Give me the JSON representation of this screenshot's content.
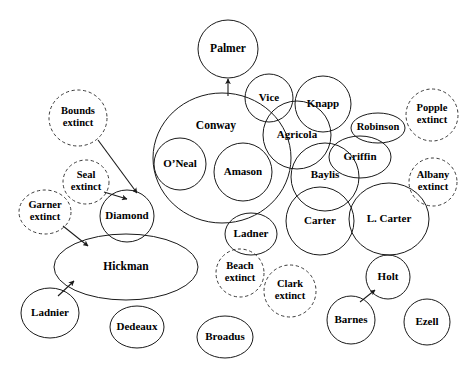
{
  "diagram": {
    "width": 473,
    "height": 369,
    "background_color": "#ffffff",
    "stroke_color": "#1a1a1a",
    "dashed_stroke_color": "#3a3a3a",
    "label_color": "#000000",
    "legend": {
      "solid_meaning": "existing family",
      "dashed_meaning": "extinct family"
    },
    "nodes": [
      {
        "id": "palmer",
        "label": "Palmer",
        "cx": 228,
        "cy": 49,
        "rx": 30,
        "ry": 29,
        "style": "solid",
        "font_size": 11.5,
        "lines": [
          "Palmer"
        ]
      },
      {
        "id": "conway",
        "label": "Conway",
        "cx": 222,
        "cy": 158,
        "rx": 69,
        "ry": 65,
        "style": "solid",
        "font_size": 11.5,
        "lines": [
          "Conway"
        ],
        "label_cx": 216,
        "label_cy": 126
      },
      {
        "id": "oneal",
        "label": "O’Neal",
        "cx": 180,
        "cy": 164,
        "rx": 26,
        "ry": 26,
        "style": "solid",
        "font_size": 11,
        "lines": [
          "O’Neal"
        ]
      },
      {
        "id": "amason",
        "label": "Amason",
        "cx": 243,
        "cy": 172,
        "rx": 29,
        "ry": 29,
        "style": "solid",
        "font_size": 11,
        "lines": [
          "Amason"
        ]
      },
      {
        "id": "vice",
        "label": "Vice",
        "cx": 269,
        "cy": 98,
        "rx": 24,
        "ry": 24,
        "style": "solid",
        "font_size": 11,
        "lines": [
          "Vice"
        ]
      },
      {
        "id": "knapp",
        "label": "Knapp",
        "cx": 323,
        "cy": 104,
        "rx": 28,
        "ry": 28,
        "style": "solid",
        "font_size": 11,
        "lines": [
          "Knapp"
        ]
      },
      {
        "id": "agricola",
        "label": "Agricola",
        "cx": 297,
        "cy": 135,
        "rx": 34,
        "ry": 34,
        "style": "solid",
        "font_size": 11,
        "lines": [
          "Agricola"
        ]
      },
      {
        "id": "robinson",
        "label": "Robinson",
        "cx": 378,
        "cy": 128,
        "rx": 27,
        "ry": 15,
        "style": "solid",
        "font_size": 10.5,
        "lines": [
          "Robinson"
        ]
      },
      {
        "id": "griffin",
        "label": "Griffin",
        "cx": 360,
        "cy": 157,
        "rx": 31,
        "ry": 21,
        "style": "solid",
        "font_size": 11,
        "lines": [
          "Griffin"
        ]
      },
      {
        "id": "baylis",
        "label": "Baylis",
        "cx": 325,
        "cy": 177,
        "rx": 34,
        "ry": 34,
        "style": "solid",
        "font_size": 11,
        "lines": [
          "Baylis"
        ],
        "label_cy": 175
      },
      {
        "id": "carter",
        "label": "Carter",
        "cx": 320,
        "cy": 221,
        "rx": 34,
        "ry": 34,
        "style": "solid",
        "font_size": 11,
        "lines": [
          "Carter"
        ]
      },
      {
        "id": "lcarter",
        "label": "L. Carter",
        "cx": 389,
        "cy": 219,
        "rx": 40,
        "ry": 36,
        "style": "solid",
        "font_size": 11,
        "lines": [
          "L. Carter"
        ]
      },
      {
        "id": "ladner",
        "label": "Ladner",
        "cx": 251,
        "cy": 234,
        "rx": 26,
        "ry": 21,
        "style": "solid",
        "font_size": 11,
        "lines": [
          "Ladner"
        ]
      },
      {
        "id": "diamond",
        "label": "Diamond",
        "cx": 127,
        "cy": 216,
        "rx": 27,
        "ry": 26,
        "style": "solid",
        "font_size": 11,
        "lines": [
          "Diamond"
        ]
      },
      {
        "id": "hickman",
        "label": "Hickman",
        "cx": 126,
        "cy": 267,
        "rx": 72,
        "ry": 33,
        "style": "solid",
        "font_size": 11.5,
        "lines": [
          "Hickman"
        ]
      },
      {
        "id": "ladnier",
        "label": "Ladnier",
        "cx": 50,
        "cy": 313,
        "rx": 29,
        "ry": 25,
        "style": "solid",
        "font_size": 11,
        "lines": [
          "Ladnier"
        ]
      },
      {
        "id": "dedeaux",
        "label": "Dedeaux",
        "cx": 137,
        "cy": 327,
        "rx": 27,
        "ry": 21,
        "style": "solid",
        "font_size": 11,
        "lines": [
          "Dedeaux"
        ]
      },
      {
        "id": "broadus",
        "label": "Broadus",
        "cx": 225,
        "cy": 337,
        "rx": 28,
        "ry": 21,
        "style": "solid",
        "font_size": 11,
        "lines": [
          "Broadus"
        ]
      },
      {
        "id": "holt",
        "label": "Holt",
        "cx": 388,
        "cy": 277,
        "rx": 22,
        "ry": 22,
        "style": "solid",
        "font_size": 11,
        "lines": [
          "Holt"
        ]
      },
      {
        "id": "barnes",
        "label": "Barnes",
        "cx": 351,
        "cy": 320,
        "rx": 24,
        "ry": 24,
        "style": "solid",
        "font_size": 11,
        "lines": [
          "Barnes"
        ]
      },
      {
        "id": "ezell",
        "label": "Ezell",
        "cx": 427,
        "cy": 322,
        "rx": 23,
        "ry": 23,
        "style": "solid",
        "font_size": 11,
        "lines": [
          "Ezell"
        ]
      },
      {
        "id": "bounds",
        "label": "Bounds extinct",
        "cx": 78,
        "cy": 118,
        "rx": 29,
        "ry": 28,
        "style": "dashed",
        "font_size": 10.5,
        "lines": [
          "Bounds",
          "extinct"
        ]
      },
      {
        "id": "seal",
        "label": "Seal extinct",
        "cx": 86,
        "cy": 182,
        "rx": 23,
        "ry": 22,
        "style": "dashed",
        "font_size": 10.5,
        "lines": [
          "Seal",
          "extinct"
        ]
      },
      {
        "id": "garner",
        "label": "Garner extinct",
        "cx": 45,
        "cy": 212,
        "rx": 26,
        "ry": 22,
        "style": "dashed",
        "font_size": 10.5,
        "lines": [
          "Garner",
          "extinct"
        ]
      },
      {
        "id": "beach",
        "label": "Beach extinct",
        "cx": 240,
        "cy": 273,
        "rx": 24,
        "ry": 24,
        "style": "dashed",
        "font_size": 10.5,
        "lines": [
          "Beach",
          "extinct"
        ]
      },
      {
        "id": "clark",
        "label": "Clark extinct",
        "cx": 290,
        "cy": 291,
        "rx": 26,
        "ry": 26,
        "style": "dashed",
        "font_size": 10.5,
        "lines": [
          "Clark",
          "extinct"
        ]
      },
      {
        "id": "popple",
        "label": "Popple extinct",
        "cx": 432,
        "cy": 115,
        "rx": 26,
        "ry": 26,
        "style": "dashed",
        "font_size": 10.5,
        "lines": [
          "Popple",
          "extinct"
        ]
      },
      {
        "id": "albany",
        "label": "Albany extinct",
        "cx": 433,
        "cy": 182,
        "rx": 24,
        "ry": 24,
        "style": "dashed",
        "font_size": 10.5,
        "lines": [
          "Albany",
          "extinct"
        ]
      }
    ],
    "edges": [
      {
        "id": "conway-palmer",
        "from": "conway",
        "to": "palmer",
        "x1": 228,
        "y1": 96,
        "x2": 228,
        "y2": 79
      },
      {
        "id": "bounds-diamond",
        "from": "bounds",
        "to": "diamond",
        "x1": 98,
        "y1": 140,
        "x2": 137,
        "y2": 193
      },
      {
        "id": "seal-diamond",
        "from": "seal",
        "to": "diamond",
        "x1": 104,
        "y1": 192,
        "x2": 127,
        "y2": 199
      },
      {
        "id": "garner-hickman",
        "from": "garner",
        "to": "hickman",
        "x1": 63,
        "y1": 226,
        "x2": 88,
        "y2": 246
      },
      {
        "id": "ladnier-hickman",
        "from": "ladnier",
        "to": "hickman",
        "x1": 58,
        "y1": 296,
        "x2": 74,
        "y2": 281
      },
      {
        "id": "barnes-holt",
        "from": "barnes",
        "to": "holt",
        "x1": 360,
        "y1": 302,
        "x2": 375,
        "y2": 290
      }
    ]
  }
}
